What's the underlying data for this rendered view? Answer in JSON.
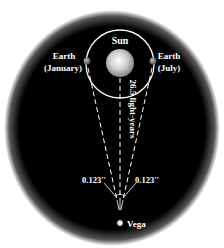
{
  "diagram": {
    "sun_label": "Sun",
    "earth_january_label_line1": "Earth",
    "earth_january_label_line2": "(January)",
    "earth_july_label_line1": "Earth",
    "earth_july_label_line2": "(July)",
    "distance_label": "26.5 light-years",
    "parallax_left_label": "0.123''",
    "parallax_right_label": "0.123''",
    "star_label": "Vega",
    "colors": {
      "background": "#000000",
      "line": "#ffffff",
      "earth": "#8a8a8a"
    }
  }
}
